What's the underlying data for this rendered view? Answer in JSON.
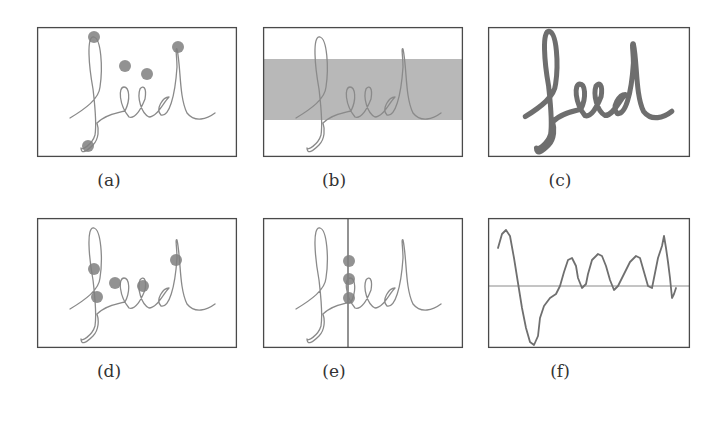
{
  "figure": {
    "panels": [
      {
        "id": "a",
        "label": "(a)",
        "description": "handwriting 'feed' with extreme points (local y-extrema) marked",
        "box": {
          "x": 37,
          "y": 27,
          "w": 200,
          "h": 130
        },
        "label_pos": {
          "x": 103,
          "y": 182
        },
        "markers": [
          [
            94,
            37
          ],
          [
            125,
            66
          ],
          [
            147,
            74
          ],
          [
            178,
            47
          ],
          [
            88,
            146
          ]
        ],
        "variant": "thin"
      },
      {
        "id": "b",
        "label": "(b)",
        "description": "handwriting 'feed' with core zone (middle band) shaded",
        "box": {
          "x": 263,
          "y": 27,
          "w": 200,
          "h": 130
        },
        "label_pos": {
          "x": 328,
          "y": 182
        },
        "band": {
          "y": 59,
          "h": 61
        },
        "variant": "thin"
      },
      {
        "id": "c",
        "label": "(c)",
        "description": "handwriting 'feed' rendered with pressure/thickness",
        "box": {
          "x": 488,
          "y": 27,
          "w": 202,
          "h": 130
        },
        "label_pos": {
          "x": 554,
          "y": 182
        },
        "variant": "thick"
      },
      {
        "id": "d",
        "label": "(d)",
        "description": "handwriting 'feed' with crossing points marked",
        "box": {
          "x": 37,
          "y": 218,
          "w": 200,
          "h": 130
        },
        "label_pos": {
          "x": 103,
          "y": 373
        },
        "markers": [
          [
            94,
            269
          ],
          [
            97,
            297
          ],
          [
            115,
            283
          ],
          [
            143,
            286
          ],
          [
            176,
            260
          ]
        ],
        "variant": "thin"
      },
      {
        "id": "e",
        "label": "(e)",
        "description": "handwriting 'feed' intersected by a vertical line with intersection points",
        "box": {
          "x": 263,
          "y": 218,
          "w": 200,
          "h": 130
        },
        "label_pos": {
          "x": 328,
          "y": 373
        },
        "vline_x": 348,
        "markers": [
          [
            349,
            261
          ],
          [
            349,
            279
          ],
          [
            349,
            298
          ]
        ],
        "variant": "thin"
      },
      {
        "id": "f",
        "label": "(f)",
        "description": "1-D signal (projection profile) with horizontal mean line",
        "box": {
          "x": 488,
          "y": 218,
          "w": 202,
          "h": 130
        },
        "label_pos": {
          "x": 554,
          "y": 373
        },
        "variant": "signal"
      }
    ],
    "word": "feed",
    "colors": {
      "border": "#4a4a4a",
      "ink": "#8a8a8a",
      "ink_dark": "#555555",
      "marker": "#7f7f7f",
      "band": "#b8b8b8",
      "caption": "#333333"
    }
  }
}
